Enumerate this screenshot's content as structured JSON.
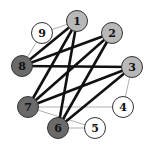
{
  "graph": {
    "nodes": [
      {
        "id": "1",
        "x": 77,
        "y": 21,
        "fill": "#b8b8b8"
      },
      {
        "id": "2",
        "x": 112,
        "y": 33,
        "fill": "#b8b8b8"
      },
      {
        "id": "3",
        "x": 132,
        "y": 67,
        "fill": "#b8b8b8"
      },
      {
        "id": "4",
        "x": 123,
        "y": 107,
        "fill": "#ffffff"
      },
      {
        "id": "5",
        "x": 95,
        "y": 128,
        "fill": "#ffffff"
      },
      {
        "id": "6",
        "x": 58,
        "y": 128,
        "fill": "#6a6a6a"
      },
      {
        "id": "7",
        "x": 28,
        "y": 107,
        "fill": "#6a6a6a"
      },
      {
        "id": "8",
        "x": 22,
        "y": 66,
        "fill": "#6a6a6a"
      },
      {
        "id": "9",
        "x": 42,
        "y": 33,
        "fill": "#ffffff"
      }
    ],
    "thick_edges": [
      [
        "8",
        "1"
      ],
      [
        "8",
        "2"
      ],
      [
        "8",
        "3"
      ],
      [
        "7",
        "1"
      ],
      [
        "7",
        "2"
      ],
      [
        "7",
        "3"
      ],
      [
        "6",
        "1"
      ],
      [
        "6",
        "2"
      ],
      [
        "6",
        "3"
      ]
    ],
    "thin_edges": [
      [
        "9",
        "1"
      ],
      [
        "9",
        "8"
      ],
      [
        "3",
        "4"
      ],
      [
        "4",
        "7"
      ],
      [
        "7",
        "5"
      ],
      [
        "6",
        "5"
      ]
    ],
    "colors": {
      "thick": "#111111",
      "thin": "#b0b0b0",
      "stroke": "#333333"
    }
  }
}
